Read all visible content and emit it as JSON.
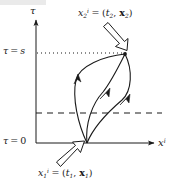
{
  "figure": {
    "type": "diagram",
    "width": 174,
    "height": 188,
    "background_color": "#ffffff",
    "ink_color": "#1a1a1a"
  },
  "axes": {
    "vertical": {
      "name_parts": {
        "symbol": "τ"
      },
      "name": "τ",
      "origin_px": {
        "x": 36,
        "y": 143
      },
      "top_px": {
        "x": 36,
        "y": 18
      }
    },
    "horizontal": {
      "name_parts": {
        "symbol": "x",
        "superscript": "i"
      },
      "name": "x",
      "superscript": "i",
      "origin_px": {
        "x": 36,
        "y": 143
      },
      "right_px": {
        "x": 157,
        "y": 143
      }
    }
  },
  "ticks": [
    {
      "id": "tau-s",
      "text_parts": {
        "symbol": "τ",
        "relation": "=",
        "value": "s"
      },
      "text": "τ = s",
      "y_px": 53,
      "guide_style": "dotted"
    },
    {
      "id": "tau-0",
      "text_parts": {
        "symbol": "τ",
        "relation": "=",
        "value": "0"
      },
      "text": "τ = 0",
      "y_px": 143,
      "guide_style": "none"
    }
  ],
  "guide_lines": [
    {
      "name": "dotted-tau-s-line",
      "style": "dotted",
      "y_px": 53,
      "x_start_px": 37,
      "x_end_px": 126,
      "color": "#1a1a1a"
    },
    {
      "name": "dashed-intermediate-line",
      "style": "dashed",
      "y_px": 113,
      "x_start_px": 36,
      "x_end_px": 162,
      "color": "#1a1a1a"
    }
  ],
  "points": [
    {
      "id": "x1",
      "label_parts": {
        "symbol": "x",
        "subscript": "1",
        "superscript": "i",
        "relation": "=",
        "tuple_time": "t",
        "tuple_time_sub": "1",
        "tuple_space": "x",
        "tuple_space_sub": "1"
      },
      "label_text": "x₁ⁱ = (t₁, x₁)",
      "position_px": {
        "x": 87,
        "y": 143
      },
      "label_position_px": {
        "x": 38,
        "y": 168
      },
      "pointer": "hollow-arrow-up-right"
    },
    {
      "id": "x2",
      "label_parts": {
        "symbol": "x",
        "subscript": "2",
        "superscript": "i",
        "relation": "=",
        "tuple_time": "t",
        "tuple_time_sub": "2",
        "tuple_space": "x",
        "tuple_space_sub": "2"
      },
      "label_text": "x₂ⁱ = (t₂, x₂)",
      "position_px": {
        "x": 125,
        "y": 54
      },
      "label_position_px": {
        "x": 78,
        "y": 8
      },
      "pointer": "hollow-arrow-down-right"
    }
  ],
  "paths": [
    {
      "id": "path-left",
      "name": "worldline-left",
      "from": "x1",
      "to": "x2",
      "arrow_at_px": {
        "x": 87,
        "y": 85
      },
      "description": "leftmost bowed worldline with mid arrowhead"
    },
    {
      "id": "path-middle",
      "name": "worldline-middle",
      "from": "x1",
      "to": "x2",
      "arrow_at_px": {
        "x": 108,
        "y": 92
      },
      "description": "central worldline with mid arrowhead"
    },
    {
      "id": "path-right",
      "name": "worldline-right",
      "from": "x1",
      "to": "x2",
      "arrow_at_px": {
        "x": 128,
        "y": 98
      },
      "description": "rightmost bowed worldline with mid arrowhead"
    }
  ],
  "pointers": [
    {
      "id": "pointer-x2",
      "name": "hollow-arrow-to-x2",
      "from_px": {
        "x": 104,
        "y": 28
      },
      "to_px": {
        "x": 122,
        "y": 50
      },
      "style": "hollow-outline"
    },
    {
      "id": "pointer-x1",
      "name": "hollow-arrow-to-x1",
      "from_px": {
        "x": 62,
        "y": 168
      },
      "to_px": {
        "x": 84,
        "y": 147
      },
      "style": "hollow-outline"
    }
  ]
}
